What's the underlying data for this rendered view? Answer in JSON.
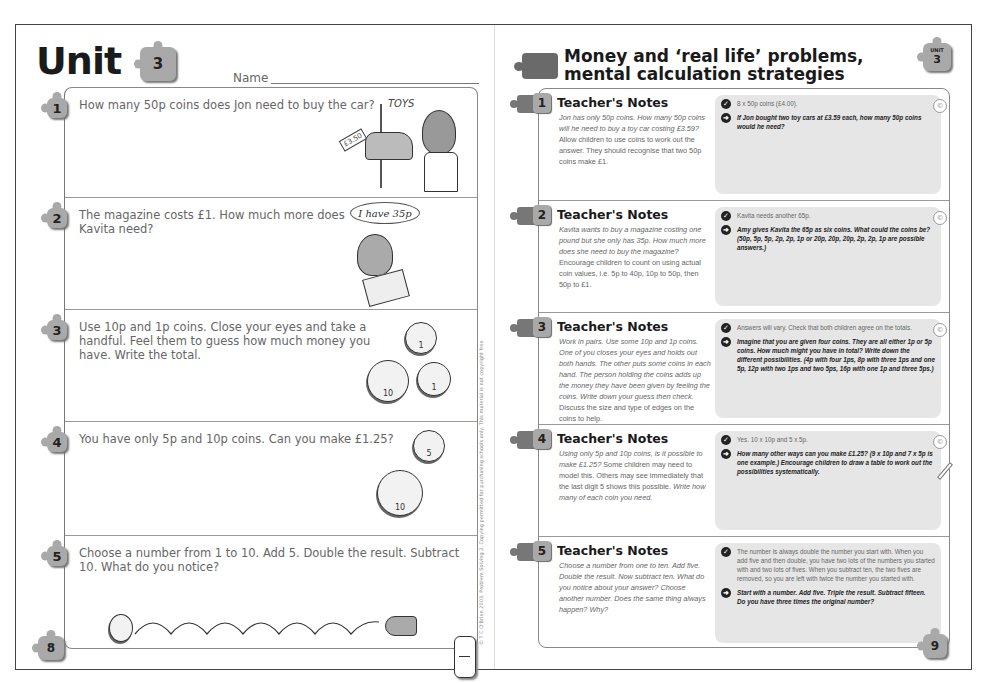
{
  "left_page": {
    "unit_title": "Unit",
    "unit_number": "3",
    "name_label": "Name",
    "page_number": "8",
    "copyright": "© T C O'Brien 2003. Problem Solving 2. Copying permitted for purchasing schools only. This material is not copyright free",
    "questions": [
      {
        "number": "1",
        "text": "How many 50p coins does Jon need to buy the car?",
        "illustration": "boy-looking-at-toy-car",
        "price_tag": "£3.50",
        "shop_sign": "TOYS"
      },
      {
        "number": "2",
        "text": "The magazine costs £1. How much more does Kavita need?",
        "illustration": "girl-with-magazine",
        "speech_bubble": "I have 35p"
      },
      {
        "number": "3",
        "text": "Use 10p and 1p coins. Close your eyes and take a handful. Feel them to guess how much money you have. Write the total.",
        "illustration": "coins-1p-10p",
        "coins": [
          "1",
          "10",
          "1"
        ]
      },
      {
        "number": "4",
        "text": "You have only 5p and 10p coins. Can you make £1.25?",
        "illustration": "coins-5p-10p",
        "coins": [
          "5",
          "10"
        ]
      },
      {
        "number": "5",
        "text": "Choose a number from 1 to 10. Add 5. Double the result. Subtract 10. What do you notice?",
        "illustration": "coin-bouncing-from-hand"
      }
    ]
  },
  "right_page": {
    "title_line1": "Money and ‘real life’ problems,",
    "title_line2": "mental calculation strategies",
    "unit_badge_label": "UNIT",
    "unit_number": "3",
    "page_number": "9",
    "notes": [
      {
        "number": "1",
        "heading": "Teacher's Notes",
        "body_italic": "Jon has only 50p coins. How many 50p coins will he need to buy a toy car costing £3.59?",
        "body_plain": "Allow children to use coins to work out the answer. They should recognise that two 50p coins make £1.",
        "answer": "8 x 50p coins (£4.00).",
        "extension": "If Jon bought two toy cars at £3.59 each, how many 50p coins would he need?"
      },
      {
        "number": "2",
        "heading": "Teacher's Notes",
        "body_italic": "Kavita wants to buy a magazine costing one pound but she only has 35p. How much more does she need to buy the magazine?",
        "body_plain": "Encourage children to count on using actual coin values, i.e. 5p to 40p, 10p to 50p, then 50p to £1.",
        "answer": "Kavita needs another 65p.",
        "extension": "Amy gives Kavita the 65p as six coins. What could the coins be? (50p, 5p, 5p, 2p, 2p, 1p or 20p, 20p, 20p, 2p, 2p, 1p are possible answers.)"
      },
      {
        "number": "3",
        "heading": "Teacher's Notes",
        "body_italic": "Work in pairs. Use some 10p and 1p coins. One of you closes your eyes and holds out both hands. The other puts some coins in each hand. The person holding the coins adds up the money they have been given by feeling the coins. Write down your guess then check.",
        "body_plain": "Discuss the size and type of edges on the coins to help.",
        "answer": "Answers will vary. Check that both children agree on the totals.",
        "extension": "Imagine that you are given four coins. They are all either 1p or 5p coins. How much might you have in total? Write down the different possibilities. (4p with four 1ps, 8p with three 1ps and one 5p, 12p with two 1ps and two 5ps, 16p with one 1p and three 5ps.)"
      },
      {
        "number": "4",
        "heading": "Teacher's Notes",
        "body_italic": "Using only 5p and 10p coins, is it possible to make £1.25?",
        "body_plain": "Some children may need to model this. Others may see immediately that the last digit 5 shows this possible.",
        "body_italic2": "Write how many of each coin you need.",
        "answer": "Yes. 10 x 10p and 5 x 5p.",
        "extension": "How many other ways can you make £1.25? (9 x 10p and 7 x 5p is one example.) Encourage children to draw a table to work out the possibilities systematically."
      },
      {
        "number": "5",
        "heading": "Teacher's Notes",
        "body_italic": "Choose a number from one to ten. Add five. Double the result. Now subtract ten. What do you notice about your answer? Choose another number. Does the same thing always happen? Why?",
        "body_plain": "",
        "answer": "The number is always double the number you start with. When you add five and then double, you have two lots of the numbers you started with and two lots of fives. When you subtract ten, the two fives are removed, so you are left with twice the number you started with.",
        "extension": "Start with a number. Add five. Triple the result. Subtract fifteen. Do you have three times the original number?"
      }
    ]
  },
  "icons": {
    "answer": "check-circle-icon",
    "extension": "arrow-circle-icon",
    "resource": "cd-icon",
    "activity": "pencil-icon"
  }
}
